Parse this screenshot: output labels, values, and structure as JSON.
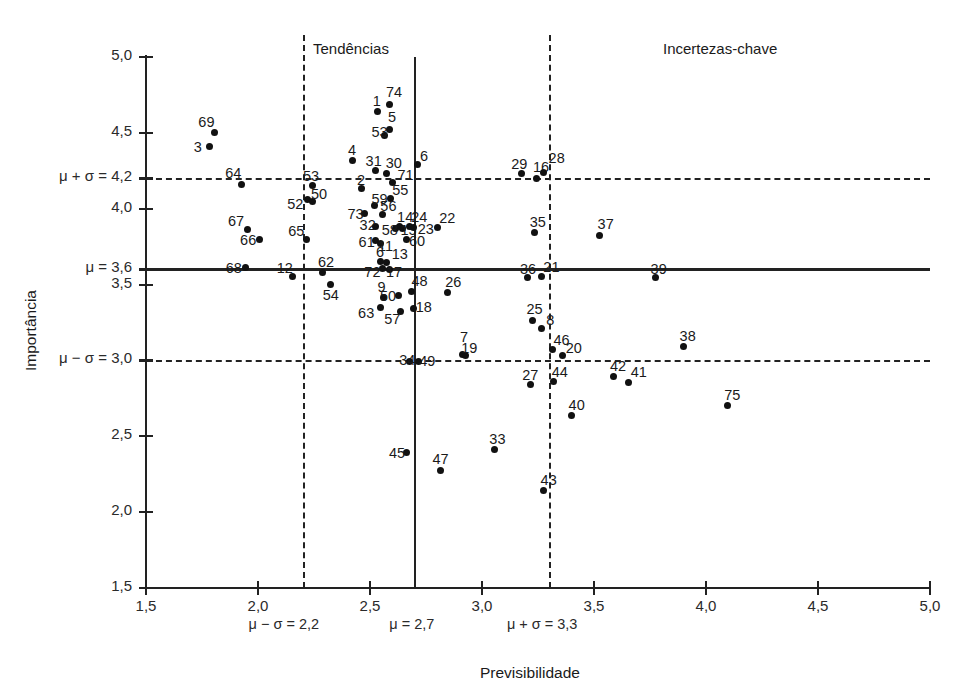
{
  "chart_data": {
    "type": "scatter",
    "title": "",
    "xlabel": "Previsibilidade",
    "ylabel": "Importância",
    "xlim": [
      1.5,
      5.0
    ],
    "ylim": [
      1.5,
      5.0
    ],
    "grid": false,
    "legend": null,
    "x_ticks": [
      "1,5",
      "2,0",
      "2,5",
      "3,0",
      "3,5",
      "4,0",
      "4,5",
      "5,0"
    ],
    "x_tick_values": [
      1.5,
      2.0,
      2.5,
      3.0,
      3.5,
      4.0,
      4.5,
      5.0
    ],
    "y_ticks": [
      "1,5",
      "2,0",
      "2,5",
      "3,0",
      "3,5",
      "3,6",
      "4,0",
      "4,2",
      "4,5",
      "5,0"
    ],
    "y_tick_values": [
      1.5,
      2.0,
      2.5,
      3.0,
      3.5,
      3.6,
      4.0,
      4.2,
      4.5,
      5.0
    ],
    "y_axis_labels": [
      {
        "text": "5,0",
        "value": 5.0
      },
      {
        "text": "4,5",
        "value": 4.5
      },
      {
        "text": "μ + σ = 4,2",
        "value": 4.2
      },
      {
        "text": "4,0",
        "value": 4.0
      },
      {
        "text": "μ = 3,6",
        "value": 3.6
      },
      {
        "text": "3,5",
        "value": 3.5
      },
      {
        "text": "μ − σ = 3,0",
        "value": 3.0
      },
      {
        "text": "2,5",
        "value": 2.5
      },
      {
        "text": "2,0",
        "value": 2.0
      },
      {
        "text": "1,5",
        "value": 1.5
      }
    ],
    "x_axis_labels": [
      {
        "text": "1,5",
        "value": 1.5
      },
      {
        "text": "2,0",
        "value": 2.0
      },
      {
        "text": "2,5",
        "value": 2.5
      },
      {
        "text": "3,0",
        "value": 3.0
      },
      {
        "text": "3,5",
        "value": 3.5
      },
      {
        "text": "4,0",
        "value": 4.0
      },
      {
        "text": "4,5",
        "value": 4.5
      },
      {
        "text": "5,0",
        "value": 5.0
      }
    ],
    "x_stat_labels": [
      {
        "text": "μ − σ = 2,2",
        "value": 2.2
      },
      {
        "text": "μ = 2,7",
        "value": 2.7
      },
      {
        "text": "μ + σ = 3,3",
        "value": 3.3
      }
    ],
    "reference_lines": [
      {
        "name": "mean-importance",
        "axis": "y",
        "value": 3.6,
        "style": "solid",
        "label": "μ = 3,6"
      },
      {
        "name": "upper-sigma-importance",
        "axis": "y",
        "value": 4.2,
        "style": "dashed",
        "label": "μ + σ = 4,2"
      },
      {
        "name": "lower-sigma-importance",
        "axis": "y",
        "value": 3.0,
        "style": "dashed",
        "label": "μ − σ = 3,0"
      },
      {
        "name": "mean-predictability",
        "axis": "x",
        "value": 2.7,
        "style": "solid",
        "label": "μ = 2,7"
      },
      {
        "name": "lower-sigma-predictability",
        "axis": "x",
        "value": 2.2,
        "style": "dashed",
        "label": "μ − σ = 2,2"
      },
      {
        "name": "upper-sigma-predictability",
        "axis": "x",
        "value": 3.3,
        "style": "dashed",
        "label": "μ + σ = 3,3"
      }
    ],
    "quadrant_labels": [
      {
        "text": "Tendências",
        "x_px": 313,
        "y_px": 40
      },
      {
        "text": "Incertezas-chave",
        "x_px": 663,
        "y_px": 40
      }
    ],
    "point_color": "#111111",
    "points": [
      {
        "label": "69",
        "x": 1.805,
        "y": 4.5,
        "lx": -16,
        "ly": -19
      },
      {
        "label": "3",
        "x": 1.785,
        "y": 4.41,
        "lx": -16,
        "ly": -8
      },
      {
        "label": "64",
        "x": 1.925,
        "y": 4.16,
        "lx": -16,
        "ly": -19
      },
      {
        "label": "67",
        "x": 1.955,
        "y": 3.86,
        "lx": -20,
        "ly": -17
      },
      {
        "label": "66",
        "x": 2.005,
        "y": 3.8,
        "lx": -19,
        "ly": -7
      },
      {
        "label": "68",
        "x": 1.945,
        "y": 3.61,
        "lx": -20,
        "ly": -8
      },
      {
        "label": "12",
        "x": 2.155,
        "y": 3.555,
        "lx": -16,
        "ly": -16
      },
      {
        "label": "52",
        "x": 2.22,
        "y": 4.06,
        "lx": -20,
        "ly": -4
      },
      {
        "label": "53",
        "x": 2.245,
        "y": 4.155,
        "lx": -10,
        "ly": -17
      },
      {
        "label": "50*",
        "x": 2.245,
        "y": 4.05,
        "lx": -2,
        "ly": -15,
        "text": "50"
      },
      {
        "label": "65",
        "x": 2.215,
        "y": 3.8,
        "lx": -18,
        "ly": -16
      },
      {
        "label": "62",
        "x": 2.29,
        "y": 3.58,
        "lx": -5,
        "ly": -18
      },
      {
        "label": "54",
        "x": 2.325,
        "y": 3.5,
        "lx": -8,
        "ly": 2
      },
      {
        "label": "4",
        "x": 2.42,
        "y": 4.32,
        "lx": -4,
        "ly": -18
      },
      {
        "label": "1",
        "x": 2.535,
        "y": 4.64,
        "lx": -5,
        "ly": -19
      },
      {
        "label": "74",
        "x": 2.585,
        "y": 4.69,
        "lx": -3,
        "ly": -20
      },
      {
        "label": "5",
        "x": 2.585,
        "y": 4.52,
        "lx": -1,
        "ly": -21
      },
      {
        "label": "53b",
        "x": 2.565,
        "y": 4.48,
        "lx": -13,
        "ly": -12,
        "text": "53"
      },
      {
        "label": "31",
        "x": 2.525,
        "y": 4.25,
        "lx": -10,
        "ly": -18
      },
      {
        "label": "30",
        "x": 2.575,
        "y": 4.235,
        "lx": -1,
        "ly": -18
      },
      {
        "label": "2",
        "x": 2.46,
        "y": 4.13,
        "lx": -4,
        "ly": -17
      },
      {
        "label": "71",
        "x": 2.6,
        "y": 4.175,
        "lx": 5,
        "ly": -15
      },
      {
        "label": "55",
        "x": 2.59,
        "y": 4.07,
        "lx": 2,
        "ly": -16
      },
      {
        "label": "73",
        "x": 2.475,
        "y": 3.97,
        "lx": -17,
        "ly": -7
      },
      {
        "label": "59",
        "x": 2.52,
        "y": 4.02,
        "lx": -3,
        "ly": -15
      },
      {
        "label": "56",
        "x": 2.555,
        "y": 3.96,
        "lx": -2,
        "ly": -17
      },
      {
        "label": "32",
        "x": 2.525,
        "y": 3.88,
        "lx": -16,
        "ly": -10
      },
      {
        "label": "14",
        "x": 2.63,
        "y": 3.88,
        "lx": -2,
        "ly": -18
      },
      {
        "label": "24",
        "x": 2.675,
        "y": 3.88,
        "lx": 2,
        "ly": -18
      },
      {
        "label": "58",
        "x": 2.615,
        "y": 3.87,
        "lx": -14,
        "ly": -6
      },
      {
        "label": "15",
        "x": 2.645,
        "y": 3.87,
        "lx": -2,
        "ly": -6
      },
      {
        "label": "23",
        "x": 2.695,
        "y": 3.875,
        "lx": 4,
        "ly": -7
      },
      {
        "label": "22",
        "x": 2.8,
        "y": 3.875,
        "lx": 2,
        "ly": -18
      },
      {
        "label": "61",
        "x": 2.525,
        "y": 3.79,
        "lx": -17,
        "ly": -7
      },
      {
        "label": "11",
        "x": 2.545,
        "y": 3.77,
        "lx": -2,
        "ly": -6
      },
      {
        "label": "60",
        "x": 2.665,
        "y": 3.8,
        "lx": 2,
        "ly": -6
      },
      {
        "label": "6",
        "x": 2.71,
        "y": 4.29,
        "lx": 3,
        "ly": -17
      },
      {
        "label": "6b",
        "x": 2.545,
        "y": 3.655,
        "lx": -4,
        "ly": -17,
        "text": "6"
      },
      {
        "label": "13",
        "x": 2.575,
        "y": 3.645,
        "lx": 5,
        "ly": -17
      },
      {
        "label": "72",
        "x": 2.555,
        "y": 3.605,
        "lx": -18,
        "ly": -5
      },
      {
        "label": "17",
        "x": 2.585,
        "y": 3.6,
        "lx": -3,
        "ly": -5
      },
      {
        "label": "9",
        "x": 2.56,
        "y": 3.415,
        "lx": -6,
        "ly": -18
      },
      {
        "label": "63",
        "x": 2.545,
        "y": 3.35,
        "lx": -22,
        "ly": -2
      },
      {
        "label": "50",
        "x": 2.625,
        "y": 3.425,
        "lx": -18,
        "ly": -8
      },
      {
        "label": "48",
        "x": 2.685,
        "y": 3.455,
        "lx": 0,
        "ly": -18
      },
      {
        "label": "57",
        "x": 2.635,
        "y": 3.325,
        "lx": -16,
        "ly": 0
      },
      {
        "label": "18",
        "x": 2.695,
        "y": 3.34,
        "lx": 2,
        "ly": -10
      },
      {
        "label": "26",
        "x": 2.845,
        "y": 3.45,
        "lx": -2,
        "ly": -18
      },
      {
        "label": "34",
        "x": 2.675,
        "y": 2.995,
        "lx": -10,
        "ly": -9
      },
      {
        "label": "49",
        "x": 2.715,
        "y": 2.99,
        "lx": 1,
        "ly": -9
      },
      {
        "label": "7",
        "x": 2.915,
        "y": 3.04,
        "lx": -3,
        "ly": -25
      },
      {
        "label": "19",
        "x": 2.925,
        "y": 3.035,
        "lx": -4,
        "ly": -15
      },
      {
        "label": "45",
        "x": 2.665,
        "y": 2.39,
        "lx": -18,
        "ly": -8
      },
      {
        "label": "47",
        "x": 2.815,
        "y": 2.275,
        "lx": -8,
        "ly": -19
      },
      {
        "label": "29",
        "x": 3.175,
        "y": 4.23,
        "lx": -10,
        "ly": -18
      },
      {
        "label": "16",
        "x": 3.245,
        "y": 4.2,
        "lx": -4,
        "ly": -19
      },
      {
        "label": "28",
        "x": 3.275,
        "y": 4.24,
        "lx": 5,
        "ly": -22
      },
      {
        "label": "35",
        "x": 3.235,
        "y": 3.845,
        "lx": -5,
        "ly": -18
      },
      {
        "label": "37",
        "x": 3.525,
        "y": 3.825,
        "lx": -2,
        "ly": -19
      },
      {
        "label": "36",
        "x": 3.205,
        "y": 3.545,
        "lx": -8,
        "ly": -17
      },
      {
        "label": "21",
        "x": 3.265,
        "y": 3.555,
        "lx": 2,
        "ly": -17
      },
      {
        "label": "39",
        "x": 3.775,
        "y": 3.545,
        "lx": -5,
        "ly": -17
      },
      {
        "label": "25",
        "x": 3.225,
        "y": 3.265,
        "lx": -6,
        "ly": -19
      },
      {
        "label": "8",
        "x": 3.265,
        "y": 3.21,
        "lx": 5,
        "ly": -17
      },
      {
        "label": "46",
        "x": 3.315,
        "y": 3.075,
        "lx": 1,
        "ly": -17
      },
      {
        "label": "20",
        "x": 3.36,
        "y": 3.035,
        "lx": 3,
        "ly": -15
      },
      {
        "label": "27",
        "x": 3.215,
        "y": 2.84,
        "lx": -8,
        "ly": -18
      },
      {
        "label": "44",
        "x": 3.32,
        "y": 2.86,
        "lx": -2,
        "ly": -18
      },
      {
        "label": "38",
        "x": 3.9,
        "y": 3.09,
        "lx": -4,
        "ly": -19
      },
      {
        "label": "42",
        "x": 3.585,
        "y": 2.895,
        "lx": -3,
        "ly": -18
      },
      {
        "label": "41",
        "x": 3.655,
        "y": 2.855,
        "lx": 2,
        "ly": -18
      },
      {
        "label": "40",
        "x": 3.4,
        "y": 2.635,
        "lx": -3,
        "ly": -19
      },
      {
        "label": "75",
        "x": 4.095,
        "y": 2.7,
        "lx": -3,
        "ly": -19
      },
      {
        "label": "33",
        "x": 3.055,
        "y": 2.415,
        "lx": -5,
        "ly": -18
      },
      {
        "label": "43",
        "x": 3.275,
        "y": 2.14,
        "lx": -3,
        "ly": -19
      }
    ]
  }
}
